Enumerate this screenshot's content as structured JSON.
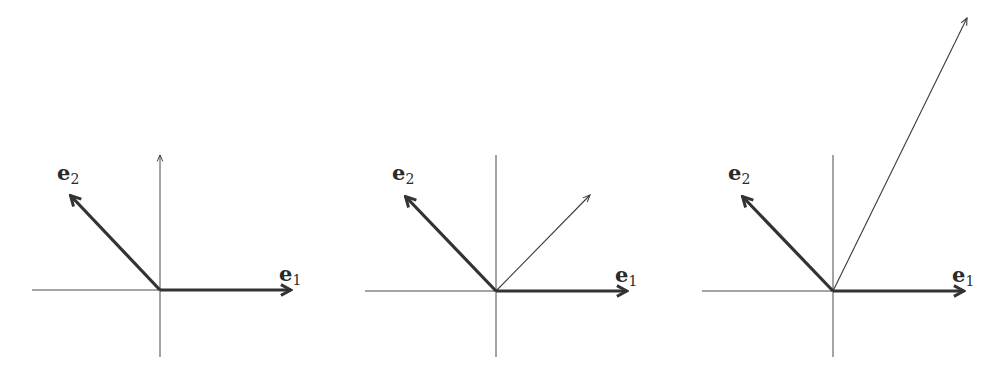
{
  "figure": {
    "colors": {
      "background": "#ffffff",
      "ink": "#333333",
      "axis": "#4a4a4a"
    },
    "panels": [
      {
        "id": "panel-1",
        "origin": [
          160,
          290
        ],
        "axes": {
          "h_from": 32,
          "h_to": 293,
          "v_from": 155,
          "v_to": 357,
          "v_arrow": true
        },
        "e1": {
          "tip": [
            293,
            290
          ],
          "label": "e",
          "sub": "1",
          "label_pos": [
            279,
            281
          ]
        },
        "e2": {
          "tip": [
            69,
            194
          ],
          "label": "e",
          "sub": "2",
          "label_pos": [
            57,
            180
          ]
        },
        "extra_vector": null
      },
      {
        "id": "panel-2",
        "origin": [
          496,
          291
        ],
        "axes": {
          "h_from": 365,
          "h_to": 629,
          "v_from": 155,
          "v_to": 357,
          "v_arrow": false
        },
        "e1": {
          "tip": [
            629,
            291
          ],
          "label": "e",
          "sub": "1",
          "label_pos": [
            615,
            282
          ]
        },
        "e2": {
          "tip": [
            404,
            195
          ],
          "label": "e",
          "sub": "2",
          "label_pos": [
            392,
            180
          ]
        },
        "extra_vector": {
          "tip": [
            590,
            195
          ],
          "label": ""
        }
      },
      {
        "id": "panel-3",
        "origin": [
          833,
          291
        ],
        "axes": {
          "h_from": 702,
          "h_to": 966,
          "v_from": 155,
          "v_to": 357,
          "v_arrow": false
        },
        "e1": {
          "tip": [
            966,
            291
          ],
          "label": "e",
          "sub": "1",
          "label_pos": [
            952,
            282
          ]
        },
        "e2": {
          "tip": [
            741,
            195
          ],
          "label": "e",
          "sub": "2",
          "label_pos": [
            728,
            180
          ]
        },
        "extra_vector": {
          "tip": [
            967,
            18
          ],
          "label": ""
        }
      }
    ]
  }
}
